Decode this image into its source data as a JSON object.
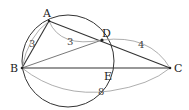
{
  "diagram": {
    "type": "geometry",
    "points": {
      "A": {
        "label": "A",
        "x": 49,
        "y": 21
      },
      "B": {
        "label": "B",
        "x": 22,
        "y": 68
      },
      "C": {
        "label": "C",
        "x": 170,
        "y": 68
      },
      "D": {
        "label": "D",
        "x": 102,
        "y": 40
      },
      "E": {
        "label": "E",
        "x": 105,
        "y": 68
      }
    },
    "circle": {
      "cx": 68,
      "cy": 61,
      "r": 46
    },
    "segments": [
      "AB",
      "AC",
      "BC",
      "BD"
    ],
    "measurements": {
      "AB": "3",
      "AD": "3",
      "DC": "4",
      "BC": "8"
    },
    "colors": {
      "line": "#333333",
      "arc": "#999999",
      "text": "#222222"
    }
  }
}
